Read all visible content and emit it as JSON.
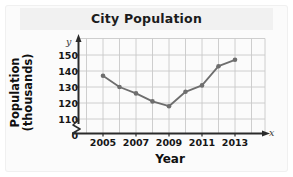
{
  "chart_data": {
    "type": "line",
    "title": "City Population",
    "xlabel": "Year",
    "ylabel_line1": "Population",
    "ylabel_line2": "(thousands)",
    "x_axis_variable": "x",
    "y_axis_variable": "y",
    "origin_label": "0",
    "axis_break": true,
    "grid": true,
    "legend": null,
    "xlim": [
      2004,
      2014
    ],
    "ylim": [
      110,
      155
    ],
    "y_ticks": [
      150,
      140,
      130,
      120,
      110
    ],
    "x_ticks": [
      2005,
      2007,
      2009,
      2011,
      2013
    ],
    "x_tick_labels": [
      "2005",
      "2007",
      "2009",
      "2011",
      "2013"
    ],
    "y_tick_labels": [
      "150",
      "140",
      "130",
      "120",
      "110"
    ],
    "x": [
      2005,
      2006,
      2007,
      2008,
      2009,
      2010,
      2011,
      2012,
      2013
    ],
    "values": [
      137,
      130,
      126,
      121,
      118,
      127,
      131,
      143,
      147
    ],
    "series_color": "#6e6e6e",
    "marker": "circle",
    "grid_color": "#c8c8c8",
    "axis_color": "#2a2a2a"
  }
}
